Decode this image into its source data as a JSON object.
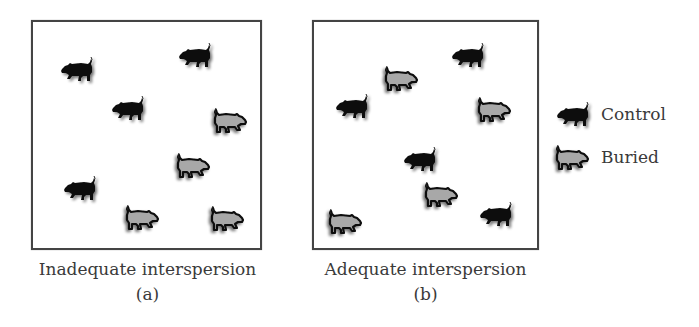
{
  "figure": {
    "panels": [
      {
        "id": "a",
        "caption": "Inadequate interspersion",
        "label": "(a)",
        "pigs": [
          {
            "type": "control"
          },
          {
            "type": "control"
          },
          {
            "type": "control"
          },
          {
            "type": "control"
          },
          {
            "type": "buried"
          },
          {
            "type": "buried"
          },
          {
            "type": "buried"
          },
          {
            "type": "buried"
          }
        ]
      },
      {
        "id": "b",
        "caption": "Adequate interspersion",
        "label": "(b)",
        "pigs": [
          {
            "type": "control"
          },
          {
            "type": "control"
          },
          {
            "type": "control"
          },
          {
            "type": "control"
          },
          {
            "type": "buried"
          },
          {
            "type": "buried"
          },
          {
            "type": "buried"
          },
          {
            "type": "buried"
          }
        ]
      }
    ],
    "legend": [
      {
        "type": "control",
        "label": "Control",
        "icon": "pig-solid-icon"
      },
      {
        "type": "buried",
        "label": "Buried",
        "icon": "pig-outline-icon"
      }
    ],
    "colors": {
      "control_fill": "#0a0a0a",
      "buried_fill": "#a8a8a8",
      "buried_outline": "#111111",
      "border": "#444444",
      "text": "#3a3a3a"
    }
  }
}
